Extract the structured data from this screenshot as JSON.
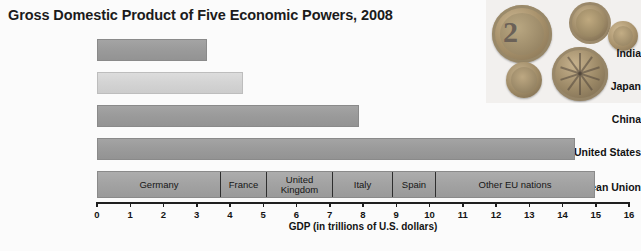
{
  "chart_data": {
    "type": "bar",
    "orientation": "horizontal",
    "title": "Gross Domestic Product of Five Economic Powers, 2008",
    "xlabel": "GDP (in trillions of U.S. dollars)",
    "ylabel": "",
    "xlim": [
      0,
      16
    ],
    "xticks": [
      "0",
      "1",
      "2",
      "3",
      "4",
      "5",
      "6",
      "7",
      "8",
      "9",
      "10",
      "11",
      "12",
      "13",
      "14",
      "15",
      "16"
    ],
    "grid": false,
    "legend": "none",
    "categories": [
      "India",
      "Japan",
      "China",
      "United States",
      "European Union"
    ],
    "values": [
      3.3,
      4.4,
      7.9,
      14.4,
      15.0
    ],
    "bars": [
      {
        "label": "India",
        "value": 3.3,
        "style": "dark"
      },
      {
        "label": "Japan",
        "value": 4.4,
        "style": "light"
      },
      {
        "label": "China",
        "value": 7.9,
        "style": "dark"
      },
      {
        "label": "United States",
        "value": 14.4,
        "style": "dark"
      },
      {
        "label": "European Union",
        "value": 15.0,
        "style": "stacked"
      }
    ],
    "stacked_segments": {
      "category": "European Union",
      "names": [
        "Germany",
        "France",
        "United Kingdom",
        "Italy",
        "Spain",
        "Other EU nations"
      ],
      "values": [
        3.7,
        1.4,
        2.0,
        1.8,
        1.3,
        4.8
      ],
      "cumulative_ends": [
        3.7,
        5.1,
        7.1,
        8.9,
        10.2,
        15.0
      ]
    },
    "annotations": [
      "Photograph of euro coins in the upper right corner"
    ]
  },
  "colors": {
    "bar_dark": "#9b9b9b",
    "bar_light": "#d4d4d4",
    "bar_stacked": "#a3a3a3",
    "segment_divider": "#2e2e2e",
    "axis": "#1f1f1f",
    "text": "#141414",
    "background": "#fbfbfb"
  },
  "photo": {
    "name": "euro-coins-photo",
    "coins": [
      {
        "denomination": "2"
      },
      {
        "denomination": "1"
      },
      {
        "denomination": "10"
      },
      {
        "denomination": "5"
      },
      {
        "denomination": "2"
      }
    ]
  }
}
